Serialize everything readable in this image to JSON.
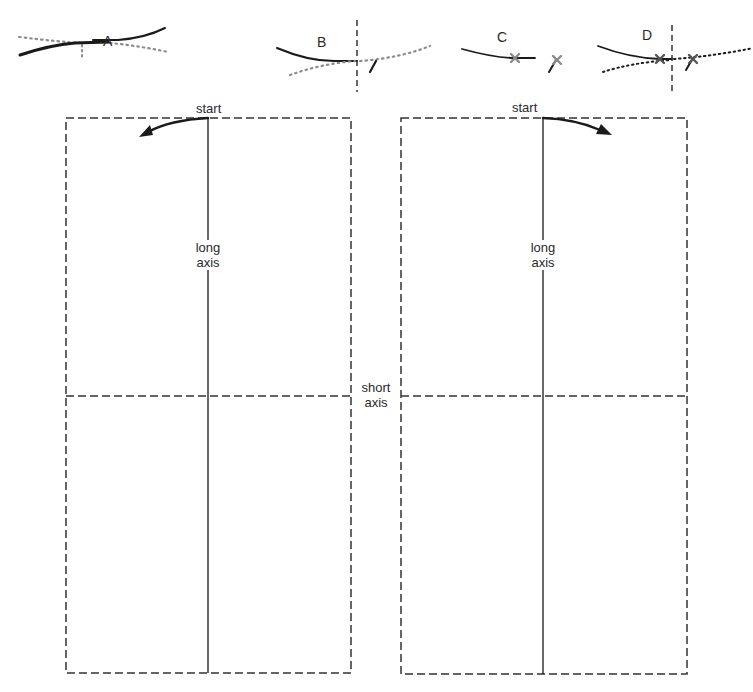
{
  "figure": {
    "panels": [
      {
        "id": "A",
        "label": "A"
      },
      {
        "id": "B",
        "label": "B"
      },
      {
        "id": "C",
        "label": "C"
      },
      {
        "id": "D",
        "label": "D"
      }
    ],
    "left_sheet": {
      "start_label": "start",
      "long_axis_line1": "long",
      "long_axis_line2": "axis",
      "arrow_direction": "counter-clockwise (left)"
    },
    "right_sheet": {
      "start_label": "start",
      "long_axis_line1": "long",
      "long_axis_line2": "axis",
      "arrow_direction": "clockwise (right)"
    },
    "short_axis_line1": "short",
    "short_axis_line2": "axis",
    "colors": {
      "solid_line": "#1a1a1a",
      "dotted_line": "#8c8c8c",
      "dashed_border": "#333333",
      "cross_mark": "#8a8a8a"
    }
  }
}
